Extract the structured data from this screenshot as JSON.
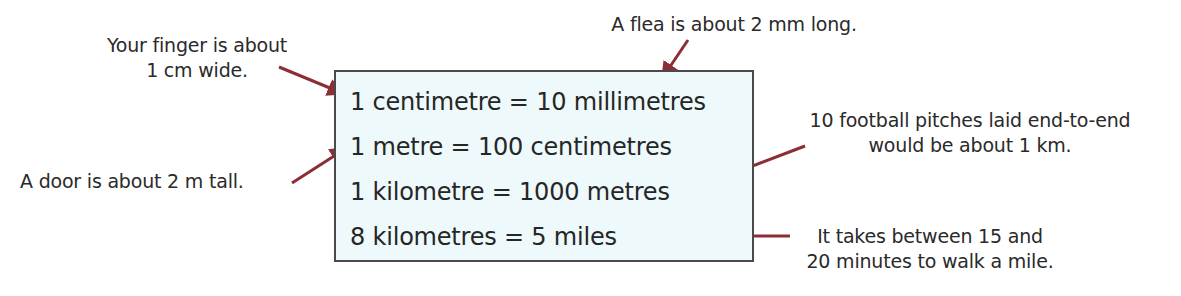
{
  "diagram": {
    "colors": {
      "box_fill": "#eef9fb",
      "box_border": "#4a4a4a",
      "arrow": "#8b2e35",
      "text": "#262626"
    },
    "facts": [
      {
        "id": "cm_mm",
        "text": "1 centimetre = 10 millimetres"
      },
      {
        "id": "m_cm",
        "text": "1 metre = 100 centimetres"
      },
      {
        "id": "km_m",
        "text": "1 kilometre = 1000 metres"
      },
      {
        "id": "km_miles",
        "text": "8 kilometres = 5 miles"
      }
    ],
    "annotations": {
      "finger": {
        "lines": [
          "Your finger is about",
          "1 cm wide."
        ],
        "points_to": "cm_mm"
      },
      "flea": {
        "lines": [
          "A flea is about 2 mm long."
        ],
        "points_to": "cm_mm"
      },
      "door": {
        "lines": [
          "A door is about 2 m tall."
        ],
        "points_to": "m_cm"
      },
      "football": {
        "lines": [
          "10 football pitches laid end-to-end",
          "would be about 1 km."
        ],
        "points_to": "km_m"
      },
      "walk": {
        "lines": [
          "It takes between 15 and",
          "20 minutes to walk a mile."
        ],
        "points_to": "km_miles"
      }
    }
  }
}
